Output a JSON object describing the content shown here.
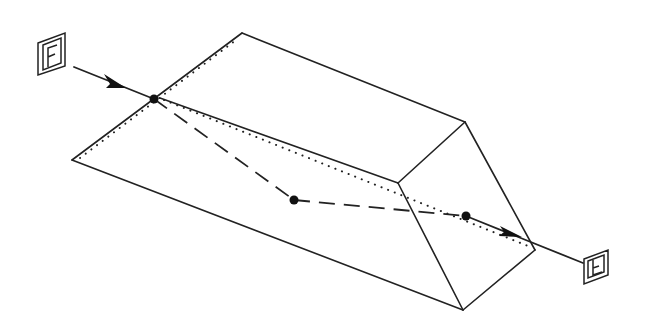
{
  "diagram": {
    "type": "prism-light-path",
    "labels": {
      "entry": "F",
      "exit": "E"
    },
    "entry_label_glyph": "F",
    "exit_label_glyph": "E (mirrored/rotated F)",
    "colors": {
      "stroke": "#222222",
      "background": "#ffffff",
      "points": "#111111"
    },
    "points": {
      "entry_point": "entry",
      "reflection_point": "internal reflection",
      "exit_point": "exit"
    },
    "line_styles": {
      "solid": "visible prism edges and external ray",
      "dashed": "ray path inside prism",
      "dotted": "hidden prism edges"
    }
  }
}
